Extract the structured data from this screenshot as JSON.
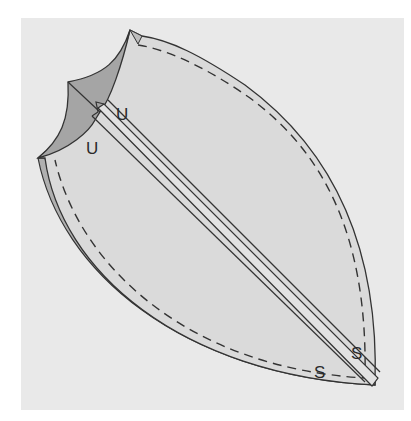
{
  "diagram": {
    "type": "sewing-pattern-illustration",
    "colors": {
      "page": "#ffffff",
      "panel": "#e9e9e9",
      "fabric": "#dadada",
      "fabric_underside": "#a9a9a9",
      "edge_band": "#b8b8b8",
      "stroke": "#333333"
    },
    "labels": [
      {
        "id": "u-top",
        "text": "U",
        "x": 122,
        "y": 120
      },
      {
        "id": "u-left",
        "text": "U",
        "x": 92,
        "y": 154
      },
      {
        "id": "s-right",
        "text": "S",
        "x": 357,
        "y": 359
      },
      {
        "id": "s-left",
        "text": "S",
        "x": 320,
        "y": 378
      }
    ]
  }
}
